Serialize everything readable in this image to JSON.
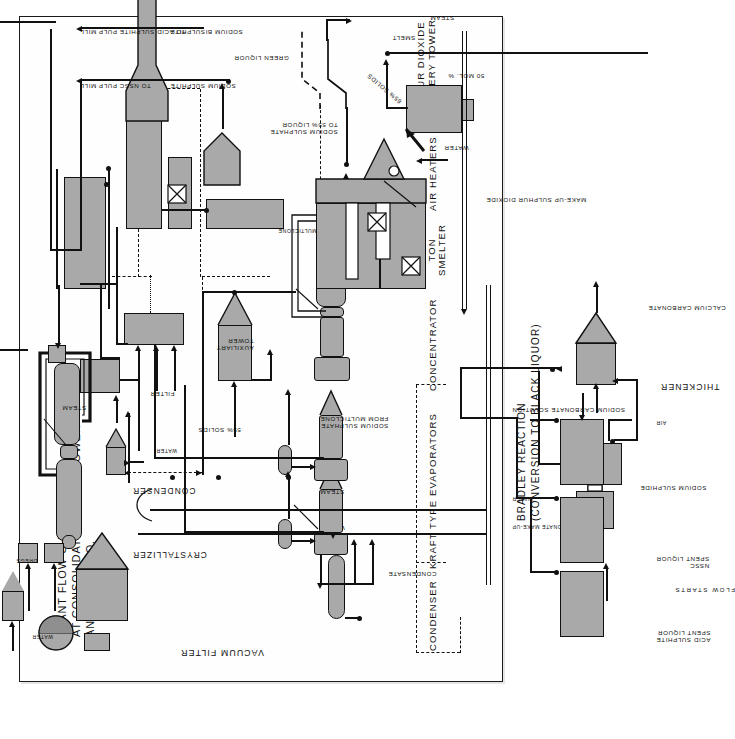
{
  "document": {
    "title_lines": [
      "PLANT FLOW CHART",
      "AT CONSOLIDATED WATER POWER",
      "AND PAPER CO."
    ],
    "flow_note": "FLOW STARTS"
  },
  "sections": {
    "condenser": "CONDENSER",
    "kraft_evaporators": "KRAFT TYPE EVAPORATORS",
    "concentrator": "CONCENTRATOR",
    "smelter": "20 KRAFT TON\nSMELTER",
    "air_heaters": "AIR HEATERS",
    "so2_recovery_tower": "SULPHUR DIOXIDE\nRECOVERY TOWER",
    "auxiliary_tower": "AUXILIARY\nTOWER",
    "filter": "FILTER",
    "crystallizer": "CRYSTALLIZER",
    "condenser2": "CONDENSER",
    "vacuum_filter": "VACUUM FILTER",
    "thickener": "THICKENER",
    "bradley_reaction": "BRADLEY REACTION",
    "bradley_sub": "(CONVERSION TO BLACK LIQUOR)",
    "multiclone": "MULTICLONE"
  },
  "streams": {
    "acid_sulphite": "ACID SULPHITE\nSPENT LIQUOR",
    "nssc": "NSSC\nSPENT LIQUOR",
    "sodium_sulphide": "SODIUM SULPHIDE",
    "calcium_carbonate": "CALCIUM CARBONATE",
    "air": "AIR",
    "sodium_carbonate_solution": "SODIUM CARBONATE SOLUTION",
    "water1": "WATER",
    "sodium_carbonate_makeup": "SODIUM CARBONATE MAKE-UP",
    "water_condenser": "WATER",
    "condensate": "CONDENSATE",
    "steam_evap1": "STEAM",
    "steam_evap2": "STEAM",
    "steam_conc": "STEAM",
    "steam_cryst": "STEAM",
    "steam_smelt": "STEAM",
    "solids_55": "55% SOLIDS",
    "solids_55b": "55% SOLIDS",
    "solids_65": "65% SOLIDS",
    "sodium_sulphate_from_multiclone": "SODIUM SULPHATE\nFROM MULTICLONE",
    "sodium_sulphate_to_55": "SODIUM SULPHATE\nTO 55% LIQUOR",
    "smelt": "SMELT",
    "water_smelt": "WATER",
    "mol_50": "50 MOL. %",
    "green_liquor": "GREEN LIQUOR",
    "makeup_so2": "MAKE-UP SULPHUR DIOXIDE",
    "water_vac": "WATER",
    "dregs": "DREGS",
    "water_cryst": "WATER",
    "to_nssc_mill": "TO NSSC PULP MILL",
    "to_acid_mill": "TO ACID SULPHITE PULP MILL",
    "sodium_sulphite": "SODIUM SULPHITE",
    "sodium_bisulphite": "SODIUM BISULPHITE"
  },
  "colors": {
    "vessel_fill": "#a9a9a9",
    "ink": "#111111",
    "paper": "#ffffff",
    "frame": "#1a1a1a"
  }
}
